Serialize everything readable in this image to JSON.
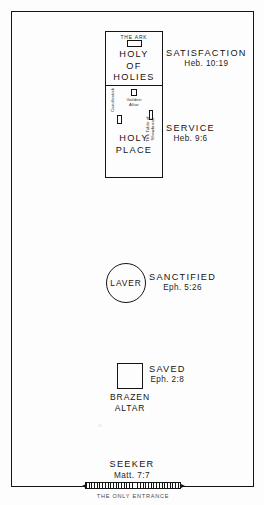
{
  "diagram": {
    "outer_court": {
      "name": "Outer Court Wall"
    },
    "sanctuary": {
      "holy_of_holies": {
        "ark_label": "THE ARK",
        "title": "HOLY\nOF\nHOLIES",
        "title_lines": [
          "HOLY",
          "OF",
          "HOLIES"
        ]
      },
      "holy_place": {
        "title_lines": [
          "HOLY",
          "PLACE"
        ],
        "golden_altar_label_lines": [
          "Golden",
          "Altar"
        ],
        "candlestick_label": "Candlestick",
        "showbread_label_lines": [
          "The Table of",
          "Showbread"
        ]
      }
    },
    "laver": {
      "label": "LAVER"
    },
    "brazen_altar": {
      "label_lines": [
        "BRAZEN",
        "ALTAR"
      ]
    },
    "gate": {
      "entrance_label": "THE ONLY ENTRANCE"
    },
    "callouts": [
      {
        "id": "satisfaction",
        "head": "SATISFACTION",
        "sub": "Heb. 10:19"
      },
      {
        "id": "service",
        "head": "SERVICE",
        "sub": "Heb. 9:6"
      },
      {
        "id": "sanctified",
        "head": "SANCTIFIED",
        "sub": "Eph. 5:26"
      },
      {
        "id": "saved",
        "head": "SAVED",
        "sub": "Eph. 2:8"
      },
      {
        "id": "seeker",
        "head": "SEEKER",
        "sub": "Matt. 7:7"
      }
    ],
    "colors": {
      "ink": "#141414",
      "paper": "#fdfdfd",
      "muted": "#4a4a4a"
    }
  }
}
